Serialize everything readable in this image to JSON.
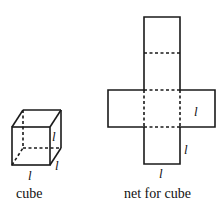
{
  "figure": {
    "cube": {
      "caption": "cube",
      "edge_labels": [
        "l",
        "l",
        "l"
      ]
    },
    "net": {
      "caption": "net for cube",
      "edge_labels": [
        "l",
        "l",
        "l"
      ]
    },
    "colors": {
      "stroke": "#1a1a1a",
      "background": "#ffffff"
    }
  }
}
